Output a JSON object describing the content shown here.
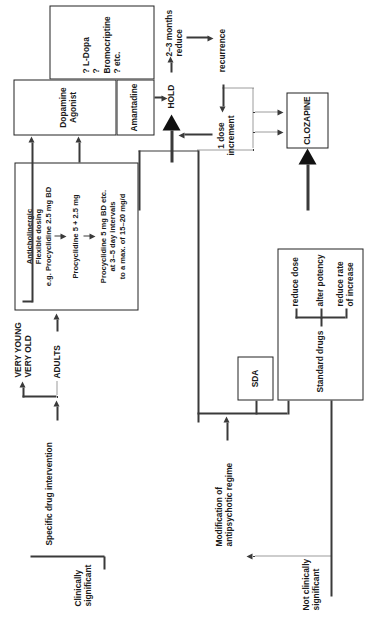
{
  "diagram": {
    "orientation": "rotated-90-ccw",
    "ink_color": "#3a3a3a",
    "box_border_color": "#222222",
    "background": "#ffffff"
  },
  "entry": {
    "not_significant": "Not clinically\nsignificant",
    "clinically_significant": "Clinically\nsignificant"
  },
  "outcomes": {
    "no_intervention": "NO INTERVENTION\n(monitor)"
  },
  "branches": {
    "modification": "Modification of\nantipsychotic regime",
    "specific_drug": "Specific drug intervention"
  },
  "age_split": {
    "adults": "ADULTS",
    "very_young_very_old": "VERY YOUNG\nVERY OLD"
  },
  "standard_drugs": {
    "heading": "Standard drugs",
    "options": [
      "reduce dose",
      "alter potency",
      "reduce rate\nof increase"
    ]
  },
  "sda": {
    "label": "SDA"
  },
  "clozapine": {
    "label": "CLOZAPINE"
  },
  "anticholinergic": {
    "heading": "Anticholinergic\nFlexible dosing\ne.g. Procyclidine 2.5 mg BD",
    "step2": "Procyclidine 5 + 2.5 mg",
    "step3": "Procyclidine 5 mg BD etc.\nat 3–5 day intervals\nto a max. of 15–20 mg/d"
  },
  "dopamine": {
    "agonist_label": "Dopamine Agonist",
    "amantadine_label": "Amantadine",
    "others": "? L-Dopa\n? Bromocriptine\n? etc."
  },
  "hold_cycle": {
    "hold": "HOLD",
    "taper": "2–3 months\nreduce",
    "recurrence": "recurrence",
    "increment": "1 dose\nincrement"
  }
}
